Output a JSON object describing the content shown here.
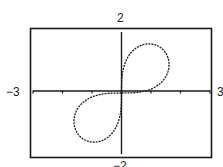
{
  "chart_data": {
    "type": "line",
    "title": "",
    "xlabel": "",
    "ylabel": "",
    "xlim": [
      -3,
      3
    ],
    "ylim": [
      -2,
      2
    ],
    "grid": false,
    "legend": null,
    "x_tick_step": 1,
    "window_labels": {
      "ymax": "2",
      "xmin": "−3",
      "xmax": "3",
      "ymin": "−2"
    },
    "series": [
      {
        "name": "r^2 = 4 sin 2θ",
        "equation": "r^2 = 4 sin 2θ",
        "style": "dashed-pixel",
        "color": "#1a1a1a"
      }
    ]
  }
}
